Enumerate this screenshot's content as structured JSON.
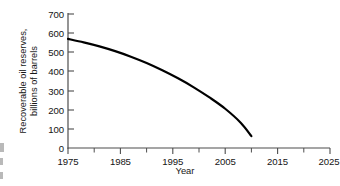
{
  "chart_data": {
    "type": "line",
    "title": "",
    "subtitle": "",
    "xlabel": "Year",
    "ylabel": "Recoverable oil reserves, billions of barrels",
    "ylabel_line1": "Recoverable oil reserves,",
    "ylabel_line2": "billions of barrels",
    "xlim": [
      1975,
      2025
    ],
    "ylim": [
      0,
      700
    ],
    "grid": false,
    "legend": "none",
    "line_color": "#000000",
    "axis_color": "#4d4d4d",
    "background_color": "#ffffff",
    "x_major_ticks": [
      1975,
      1985,
      1995,
      2005,
      2015,
      2025
    ],
    "x_minor_ticks": [
      1980,
      1990,
      2000,
      2010,
      2020
    ],
    "x_tick_labels": [
      "1975",
      "1985",
      "1995",
      "2005",
      "2015",
      "2025"
    ],
    "y_ticks": [
      0,
      100,
      200,
      300,
      400,
      500,
      600,
      700
    ],
    "y_tick_labels": [
      "0",
      "100",
      "200",
      "300",
      "400",
      "500",
      "600",
      "700"
    ],
    "series": [
      {
        "name": "Recoverable oil reserves",
        "x": [
          1975,
          1978,
          1981,
          1984,
          1987,
          1990,
          1993,
          1996,
          1999,
          2002,
          2005,
          2008,
          2010
        ],
        "values": [
          570,
          552,
          531,
          506,
          477,
          444,
          406,
          364,
          317,
          264,
          205,
          131,
          62
        ]
      }
    ]
  }
}
